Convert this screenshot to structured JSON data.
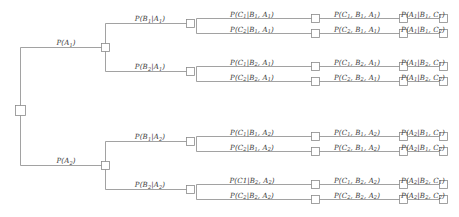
{
  "diagram": {
    "type": "probability-tree",
    "colors": {
      "line": "#8a8a8a",
      "node_stroke": "#8a8a8a",
      "node_fill": "#ffffff",
      "text": "#3b3b3b",
      "background": "#ffffff"
    },
    "root": {
      "name": "root-node"
    },
    "level_a": [
      {
        "id": "A1",
        "label": "P(A<sub>1</sub>)",
        "text": "P(A1)"
      },
      {
        "id": "A2",
        "label": "P(A<sub>2</sub>)",
        "text": "P(A2)"
      }
    ],
    "level_b": [
      {
        "id": "B1A1",
        "label": "P(B<sub>1</sub>|A<sub>1</sub>)",
        "text": "P(B1|A1)"
      },
      {
        "id": "B2A1",
        "label": "P(B<sub>2</sub>|A<sub>1</sub>)",
        "text": "P(B2|A1)"
      },
      {
        "id": "B1A2",
        "label": "P(B<sub>1</sub>|A<sub>2</sub>)",
        "text": "P(B1|A2)"
      },
      {
        "id": "B2A2",
        "label": "P(B<sub>2</sub>|A<sub>2</sub>)",
        "text": "P(B2|A2)"
      }
    ],
    "blocks": [
      {
        "id": "block-b1a1",
        "rows": [
          {
            "conditional": "P(C<sub>1</sub>|B<sub>1</sub>, A<sub>1</sub>)",
            "joint": "P(C<sub>1</sub>, B<sub>1</sub>, A<sub>1</sub>)",
            "posterior": "P(A<sub>1</sub>|B<sub>1</sub>, C<sub>1</sub>)"
          },
          {
            "conditional": "P(C<sub>2</sub>|B<sub>1</sub>, A<sub>1</sub>)",
            "joint": "P(C<sub>2</sub>, B<sub>1</sub>, A<sub>1</sub>)",
            "posterior": "P(A<sub>1</sub>|B<sub>1</sub>, C<sub>2</sub>)"
          }
        ]
      },
      {
        "id": "block-b2a1",
        "rows": [
          {
            "conditional": "P(C<sub>1</sub>|B<sub>2</sub>, A<sub>1</sub>)",
            "joint": "P(C<sub>1</sub>, B<sub>2</sub>, A<sub>1</sub>)",
            "posterior": "P(A<sub>1</sub>|B<sub>2</sub>, C<sub>1</sub>)"
          },
          {
            "conditional": "P(C<sub>2</sub>|B<sub>2</sub>, A<sub>1</sub>)",
            "joint": "P(C<sub>2</sub>, B<sub>2</sub>, A<sub>1</sub>)",
            "posterior": "P(A<sub>1</sub>|B<sub>2</sub>, C<sub>2</sub>)"
          }
        ]
      },
      {
        "id": "block-b1a2",
        "rows": [
          {
            "conditional": "P(C<sub>1</sub>|B<sub>1</sub>, A<sub>2</sub>)",
            "joint": "P(C<sub>1</sub>, B<sub>1</sub>, A<sub>2</sub>)",
            "posterior": "P(A<sub>2</sub>|B<sub>1</sub>, C<sub>1</sub>)"
          },
          {
            "conditional": "P(C<sub>2</sub>|B<sub>1</sub>, A<sub>2</sub>)",
            "joint": "P(C<sub>2</sub>, B<sub>1</sub>, A<sub>2</sub>)",
            "posterior": "P(A<sub>2</sub>|B<sub>1</sub>, C<sub>2</sub>)"
          }
        ]
      },
      {
        "id": "block-b2a2",
        "rows": [
          {
            "conditional": "P(C1|B<sub>2</sub>, A<sub>2</sub>)",
            "joint": "P(C<sub>1</sub>, B<sub>2</sub>, A<sub>2</sub>)",
            "posterior": "P(A<sub>2</sub>|B<sub>2</sub>, C<sub>1</sub>)"
          },
          {
            "conditional": "P(C<sub>2</sub>|B<sub>2</sub>, A<sub>2</sub>)",
            "joint": "P(C<sub>2</sub>, B<sub>2</sub>, A<sub>2</sub>)",
            "posterior": "P(A<sub>2</sub>|B<sub>2</sub>, C<sub>2</sub>)"
          }
        ]
      }
    ]
  }
}
